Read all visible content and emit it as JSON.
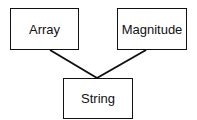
{
  "diagram": {
    "type": "class-hierarchy",
    "nodes": [
      {
        "id": "array",
        "label": "Array"
      },
      {
        "id": "magnitude",
        "label": "Magnitude"
      },
      {
        "id": "string",
        "label": "String"
      }
    ],
    "edges": [
      {
        "from": "string",
        "to": "array"
      },
      {
        "from": "string",
        "to": "magnitude"
      }
    ]
  }
}
